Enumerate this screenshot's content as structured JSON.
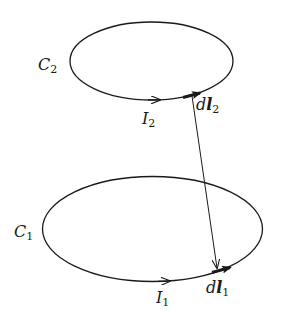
{
  "diagram": {
    "type": "two current loops with line elements",
    "loops": [
      {
        "id": "C2",
        "label_main": "C",
        "label_sub": "2",
        "current_main": "I",
        "current_sub": "2",
        "element_main": "d",
        "element_bold": "l",
        "element_sub": "2"
      },
      {
        "id": "C1",
        "label_main": "C",
        "label_sub": "1",
        "current_main": "I",
        "current_sub": "1",
        "element_main": "d",
        "element_bold": "l",
        "element_sub": "1"
      }
    ],
    "connector": "separation vector from dl2 to dl1",
    "colors": {
      "ink": "#1a1a1a",
      "background": "#ffffff"
    }
  }
}
